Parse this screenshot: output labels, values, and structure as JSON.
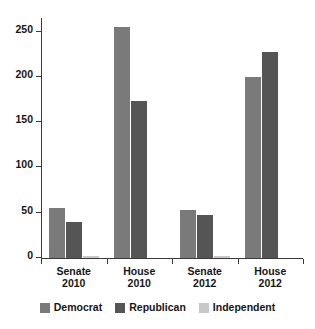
{
  "chart_data": {
    "type": "bar",
    "title": "",
    "subtitle": "",
    "xlabel": "",
    "ylabel": "",
    "categories": [
      "Senate\n2010",
      "House\n2010",
      "Senate\n2012",
      "House\n2012"
    ],
    "category_lines": [
      [
        "Senate",
        "2010"
      ],
      [
        "House",
        "2010"
      ],
      [
        "Senate",
        "2012"
      ],
      [
        "House",
        "2012"
      ]
    ],
    "series": [
      {
        "name": "Democrat",
        "color": "#7a7a7a",
        "values": [
          55,
          255,
          53,
          200
        ]
      },
      {
        "name": "Republican",
        "color": "#555555",
        "values": [
          40,
          173,
          47,
          228
        ]
      },
      {
        "name": "Independent",
        "color": "#c8c8c8",
        "values": [
          2,
          0,
          2,
          0
        ]
      }
    ],
    "yticks": [
      0,
      50,
      100,
      150,
      200,
      250
    ],
    "ytick_labels": [
      "0",
      "50",
      "100",
      "150",
      "200",
      "250"
    ],
    "ylim": [
      0,
      265
    ],
    "grid": false,
    "legend_position": "bottom",
    "legend_entries": [
      "Democrat",
      "Republican",
      "Independent"
    ]
  },
  "legend": {
    "items": [
      {
        "label": "Democrat"
      },
      {
        "label": "Republican"
      },
      {
        "label": "Independent"
      }
    ]
  }
}
